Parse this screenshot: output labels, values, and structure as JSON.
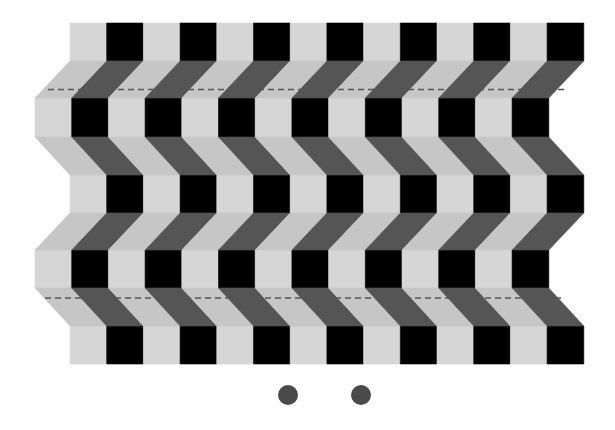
{
  "illusion": {
    "name": "Café wall / zig-zag shelf illusion",
    "colors": {
      "background": "#ffffff",
      "light_cell": "#d6d6d6",
      "band_light": "#c6c6c6",
      "dark_cell": "#000000",
      "band_dark": "#555555",
      "dash": "#555555",
      "dot": "#4a4a4a"
    },
    "grid": {
      "pairs": 7,
      "cell_width": 36.7,
      "rows": [
        {
          "top": 23,
          "bottom": 61,
          "x": 70
        },
        {
          "top": 98,
          "bottom": 137,
          "x": 35
        },
        {
          "top": 175,
          "bottom": 213,
          "x": 70
        },
        {
          "top": 250,
          "bottom": 288,
          "x": 35
        },
        {
          "top": 326,
          "bottom": 364,
          "x": 70
        }
      ]
    },
    "dashed_lines": [
      {
        "y": 89.5,
        "x1": 48,
        "x2": 565
      },
      {
        "y": 298,
        "x1": 45,
        "x2": 565
      }
    ],
    "dots": [
      {
        "cx": 288,
        "cy": 395,
        "r": 10
      },
      {
        "cx": 361,
        "cy": 395,
        "r": 10
      }
    ]
  }
}
